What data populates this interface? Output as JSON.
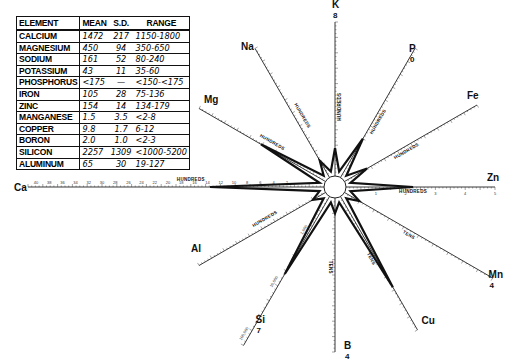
{
  "table": {
    "headers": [
      "ELEMENT",
      "MEAN",
      "S.D.",
      "RANGE"
    ],
    "rows": [
      {
        "element": "CALCIUM",
        "mean": "1472",
        "sd": "217",
        "range": "1150-1800"
      },
      {
        "element": "MAGNESIUM",
        "mean": "450",
        "sd": "94",
        "range": "350-650"
      },
      {
        "element": "SODIUM",
        "mean": "161",
        "sd": "52",
        "range": "80-240"
      },
      {
        "element": "POTASSIUM",
        "mean": "43",
        "sd": "11",
        "range": "35-60"
      },
      {
        "element": "PHOSPHORUS",
        "mean": "<175",
        "sd": "—",
        "range": "<150-<175"
      },
      {
        "element": "IRON",
        "mean": "105",
        "sd": "28",
        "range": "75-136"
      },
      {
        "element": "ZINC",
        "mean": "154",
        "sd": "14",
        "range": "134-179"
      },
      {
        "element": "MANGANESE",
        "mean": "1.5",
        "sd": "3.5",
        "range": "<2-8"
      },
      {
        "element": "COPPER",
        "mean": "9.8",
        "sd": "1.7",
        "range": "6-12"
      },
      {
        "element": "BORON",
        "mean": "2.0",
        "sd": "1.0",
        "range": "<2-3"
      },
      {
        "element": "SILICON",
        "mean": "2257",
        "sd": "1309",
        "range": "<1000-5200"
      },
      {
        "element": "ALUMINUM",
        "mean": "65",
        "sd": "30",
        "range": "19-127"
      }
    ]
  },
  "chart_data": {
    "type": "radar",
    "title": "",
    "center": [
      335,
      187
    ],
    "axes": [
      {
        "label": "K",
        "corner_num": "8",
        "unit": "HUNDREDS",
        "angle_deg": -90,
        "length": 165,
        "value_frac": 0.18
      },
      {
        "label": "P",
        "corner_num": "0",
        "unit": "HUNDREDS",
        "angle_deg": -60,
        "length": 160,
        "value_frac": 0.3
      },
      {
        "label": "Fe",
        "corner_num": "",
        "unit": "HUNDREDS",
        "angle_deg": -30,
        "length": 164,
        "value_frac": 0.17
      },
      {
        "label": "Zn",
        "corner_num": "",
        "unit": "HUNDREDS",
        "angle_deg": 0,
        "length": 160,
        "value_frac": 0.45
      },
      {
        "label": "Mn",
        "corner_num": "4",
        "unit": "TENS",
        "angle_deg": 30,
        "length": 182,
        "value_frac": 0.1
      },
      {
        "label": "Cu",
        "corner_num": "",
        "unit": "TENS",
        "angle_deg": 60,
        "length": 165,
        "value_frac": 0.68
      },
      {
        "label": "B",
        "corner_num": "4",
        "unit": "TENS",
        "angle_deg": 90,
        "length": 165,
        "value_frac": 0.1
      },
      {
        "label": "Si",
        "corner_num": "7",
        "unit": "",
        "angle_deg": 120,
        "length": 183,
        "value_frac": 0.52
      },
      {
        "label": "Al",
        "corner_num": "",
        "unit": "HUNDREDS",
        "angle_deg": 150,
        "length": 157,
        "value_frac": 0.1
      },
      {
        "label": "Ca",
        "corner_num": "",
        "unit": "HUNDREDS",
        "angle_deg": 180,
        "length": 307,
        "value_frac": 0.385
      },
      {
        "label": "Mg",
        "corner_num": "",
        "unit": "HUNDREDS",
        "angle_deg": -150,
        "length": 157,
        "value_frac": 0.51
      },
      {
        "label": "Na",
        "corner_num": "",
        "unit": "HUNDREDS",
        "angle_deg": -120,
        "length": 160,
        "value_frac": 0.13
      }
    ],
    "ca_ticks": [
      "40",
      "38",
      "36",
      "34",
      "32",
      "30",
      "28",
      "26",
      "24",
      "22",
      "20",
      "18",
      "16",
      "14",
      "12",
      "10",
      "8",
      "6",
      "4",
      "2"
    ],
    "zn_ticks": [
      "1",
      "2",
      "3",
      "4",
      "5"
    ],
    "si_ticks": [
      "1,000",
      "10,000",
      "100,000"
    ],
    "mg_ticks": [
      "10",
      "9",
      "8",
      "7",
      "6",
      "5",
      "4",
      "3",
      "2"
    ],
    "na_ticks": [
      "10",
      "9",
      "8",
      "7",
      "6",
      "5",
      "4",
      "3",
      "2"
    ],
    "fe_ticks": [
      "3",
      "4",
      "5",
      "6",
      "7",
      "8",
      "9",
      "10"
    ],
    "mn_ticks": [
      "2",
      "3",
      "4",
      "5",
      "6",
      "7",
      "8",
      "9",
      "10"
    ],
    "al_ticks": [
      "10",
      "9",
      "8",
      "7",
      "6",
      "5",
      "4",
      "3",
      "2"
    ]
  }
}
